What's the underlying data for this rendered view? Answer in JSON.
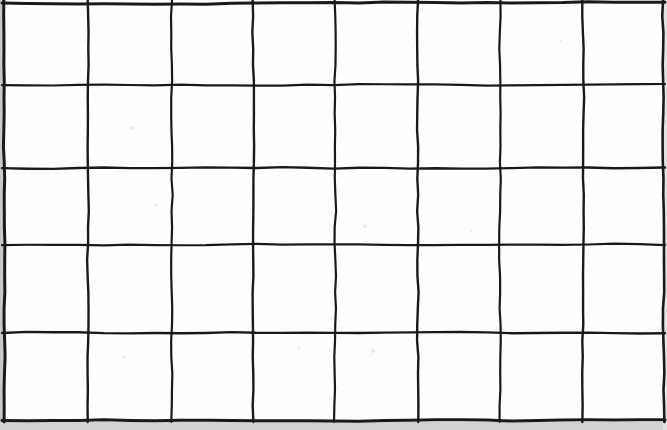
{
  "image": {
    "kind": "hand-drawn-grid",
    "title": "Hand-drawn grid on white paper",
    "width": 667,
    "height": 430,
    "background_color": "#fefefe",
    "ink_color": "#1a1a1a"
  },
  "grid": {
    "columns": 8,
    "rows": 5,
    "cell_count": 40,
    "vertical_line_x": [
      4,
      88,
      172,
      253,
      335,
      418,
      500,
      583,
      663
    ],
    "horizontal_line_y": [
      3,
      85,
      168,
      245,
      333,
      420
    ],
    "stroke_widths": [
      3.0,
      2.4,
      2.2,
      2.4,
      2.2,
      2.4,
      2.2,
      2.4,
      2.6
    ],
    "horizontal_stroke_widths": [
      3.0,
      2.2,
      2.4,
      2.2,
      2.4,
      3.0
    ],
    "wobble_amplitude_px": 1.6,
    "style": "freehand ink, slight wobble, uneven thickness"
  },
  "scan_edges": {
    "left_margin": {
      "x": 0,
      "y": 0,
      "width": 4,
      "height": 430,
      "color": "#c9c9c9"
    },
    "bottom_margin": {
      "x": 0,
      "y": 422,
      "width": 667,
      "height": 8,
      "color": "#d2d2d2"
    },
    "right_margin": {
      "x": 663,
      "y": 0,
      "width": 4,
      "height": 430,
      "color": "#e2e2e2"
    }
  },
  "cells": {
    "label": "empty cells",
    "contents": [
      [
        "",
        "",
        "",
        "",
        "",
        "",
        "",
        ""
      ],
      [
        "",
        "",
        "",
        "",
        "",
        "",
        "",
        ""
      ],
      [
        "",
        "",
        "",
        "",
        "",
        "",
        "",
        ""
      ],
      [
        "",
        "",
        "",
        "",
        "",
        "",
        "",
        ""
      ],
      [
        "",
        "",
        "",
        "",
        "",
        "",
        "",
        ""
      ]
    ]
  },
  "specks": [
    {
      "x": 132,
      "y": 128,
      "r": 2.0
    },
    {
      "x": 156,
      "y": 205,
      "r": 1.6
    },
    {
      "x": 365,
      "y": 226,
      "r": 1.8
    },
    {
      "x": 471,
      "y": 231,
      "r": 1.5
    },
    {
      "x": 373,
      "y": 351,
      "r": 2.2
    },
    {
      "x": 299,
      "y": 348,
      "r": 1.4
    },
    {
      "x": 124,
      "y": 357,
      "r": 1.6
    },
    {
      "x": 561,
      "y": 41,
      "r": 1.5
    }
  ]
}
